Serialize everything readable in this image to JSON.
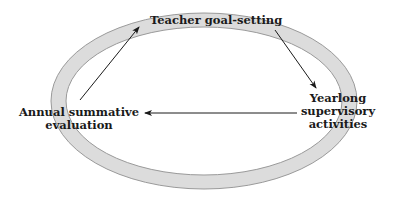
{
  "diagram": {
    "type": "cycle",
    "nodes": {
      "top": {
        "label": "Teacher goal-setting"
      },
      "left": {
        "lines": [
          "Annual summative",
          "evaluation"
        ]
      },
      "right": {
        "lines": [
          "Yearlong",
          "supervisory",
          "activities"
        ]
      }
    },
    "edges": [
      {
        "from": "Annual summative evaluation",
        "to": "Teacher goal-setting"
      },
      {
        "from": "Teacher goal-setting",
        "to": "Yearlong supervisory activities"
      },
      {
        "from": "Yearlong supervisory activities",
        "to": "Annual summative evaluation"
      }
    ],
    "colors": {
      "ring_fill": "#dcdcdc",
      "ring_stroke": "#9a9a9a",
      "arrow": "#1a1a1a",
      "text": "#1a1a1a"
    }
  }
}
